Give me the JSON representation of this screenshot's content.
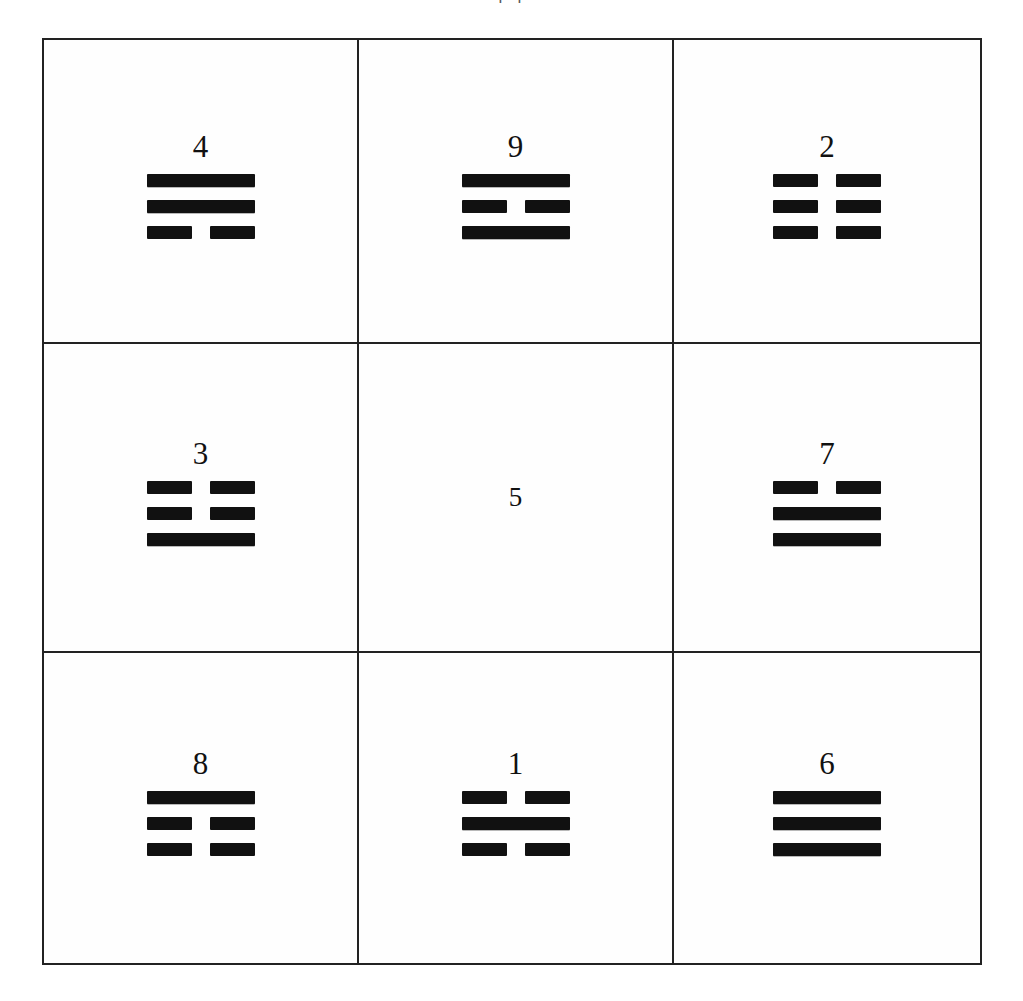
{
  "page": {
    "caption_fragment": "[ ]",
    "background_color": "#ffffff",
    "ink_color": "#111111",
    "border_color": "#222222"
  },
  "grid": {
    "rows": 3,
    "columns": 3,
    "cells": [
      {
        "id": "cell-4",
        "number": "4",
        "lines": [
          "yang",
          "yang",
          "yin"
        ],
        "position": "top-left"
      },
      {
        "id": "cell-9",
        "number": "9",
        "lines": [
          "yang",
          "yin",
          "yang"
        ],
        "position": "top-center"
      },
      {
        "id": "cell-2",
        "number": "2",
        "lines": [
          "yin",
          "yin",
          "yin"
        ],
        "position": "top-right"
      },
      {
        "id": "cell-3",
        "number": "3",
        "lines": [
          "yin",
          "yin",
          "yang"
        ],
        "position": "middle-left"
      },
      {
        "id": "cell-5",
        "number": "5",
        "lines": [],
        "position": "middle-center"
      },
      {
        "id": "cell-7",
        "number": "7",
        "lines": [
          "yin",
          "yang",
          "yang"
        ],
        "position": "middle-right"
      },
      {
        "id": "cell-8",
        "number": "8",
        "lines": [
          "yang",
          "yin",
          "yin"
        ],
        "position": "bottom-left"
      },
      {
        "id": "cell-1",
        "number": "1",
        "lines": [
          "yin",
          "yang",
          "yin"
        ],
        "position": "bottom-center"
      },
      {
        "id": "cell-6",
        "number": "6",
        "lines": [
          "yang",
          "yang",
          "yang"
        ],
        "position": "bottom-right"
      }
    ]
  }
}
